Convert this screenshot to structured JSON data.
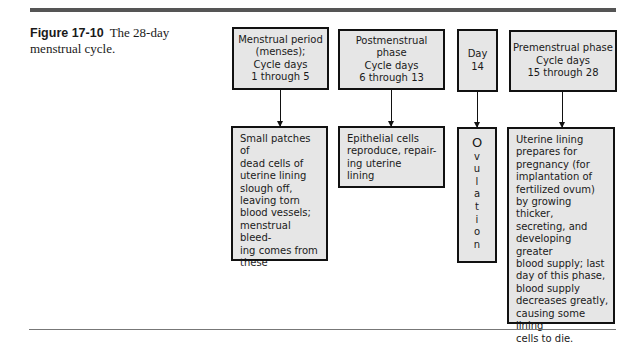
{
  "caption": {
    "figure_number": "Figure 17-10",
    "title": "The 28-day menstrual cycle."
  },
  "phases": [
    {
      "id": "menstrual-period",
      "header": "Menstrual period\n(menses);\nCycle days\n1 through 5",
      "description": "Small patches of\ndead cells of\nuterine lining\nslough off,\nleaving torn\nblood vessels;\nmenstrual bleed-\ning comes from\nthese"
    },
    {
      "id": "postmenstrual-phase",
      "header": "Postmenstrual phase\nCycle days\n6 through 13",
      "description": "Epithelial cells\nreproduce, repair-\ning uterine\nlining"
    },
    {
      "id": "day-14",
      "header": "Day\n14",
      "description": "O\nv\nu\nl\na\nt\ni\no\nn"
    },
    {
      "id": "premenstrual-phase",
      "header": "Premenstrual phase\nCycle days\n15 through 28",
      "description": "Uterine lining\nprepares for\npregnancy (for\nimplantation of\nfertilized ovum)\nby growing thicker,\nsecreting, and\ndeveloping greater\nblood supply; last\nday of this phase,\nblood supply\ndecreases greatly,\ncausing some lining\ncells to die."
    }
  ],
  "colors": {
    "box_fill": "#e6e6e6",
    "box_border": "#111111",
    "rule": "#555555"
  }
}
